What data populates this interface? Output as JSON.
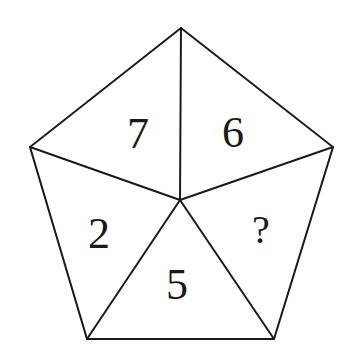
{
  "figure": {
    "type": "pentagon-number-puzzle",
    "background_color": "#ffffff",
    "line_color": "#1a1a1a",
    "vertices": {
      "top": [
        181,
        28
      ],
      "left": [
        30,
        147
      ],
      "right": [
        333,
        147
      ],
      "bottom_left": [
        87,
        339
      ],
      "bottom_right": [
        274,
        339
      ],
      "center": [
        180,
        200
      ]
    },
    "sections": [
      {
        "position": "upper-left",
        "value": "7"
      },
      {
        "position": "upper-right",
        "value": "6"
      },
      {
        "position": "right",
        "value": "?"
      },
      {
        "position": "bottom",
        "value": "5"
      },
      {
        "position": "left",
        "value": "2"
      }
    ]
  }
}
